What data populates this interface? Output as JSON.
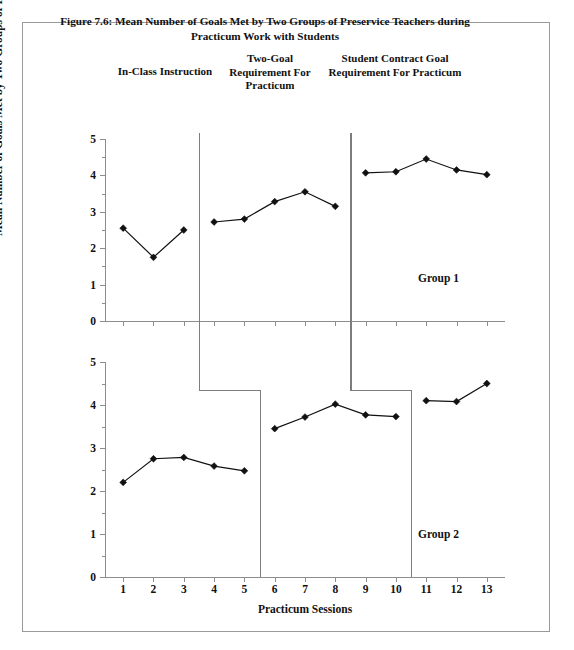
{
  "figure": {
    "title": "Figure 7.6: Mean Number of Goals Met by Two Groups of Preservice Teachers during Practicum Work with Students"
  },
  "phase_labels": [
    "In-Class Instruction",
    "Two-Goal Requirement For Practicum",
    "Student Contract Goal Requirement For Practicum"
  ],
  "group_labels": {
    "upper": "Group 1",
    "lower": "Group 2"
  },
  "axis_titles": {
    "y": "Mean Number of Goals Met by Two Groups of Preservice Teachers",
    "x": "Practicum Sessions"
  },
  "chart_data": [
    {
      "type": "line",
      "title": "Group 1",
      "xlabel": "Practicum Sessions",
      "ylabel": "Mean Number of Goals Met by Two Groups of Preservice Teachers",
      "x": [
        1,
        2,
        3,
        4,
        5,
        6,
        7,
        8,
        9,
        10,
        11,
        12,
        13
      ],
      "xticklabels": [
        "1",
        "2",
        "3",
        "4",
        "5",
        "6",
        "7",
        "8",
        "9",
        "10",
        "11",
        "12",
        "13"
      ],
      "yticklabels": [
        "0",
        "1",
        "2",
        "3",
        "4",
        "5"
      ],
      "ylim": [
        0,
        5
      ],
      "xlim": [
        0.4,
        13.6
      ],
      "grid": false,
      "legend": false,
      "phases": [
        {
          "label": "In-Class Instruction",
          "x": [
            1,
            2,
            3
          ],
          "values": [
            2.55,
            1.75,
            2.5
          ]
        },
        {
          "label": "Two-Goal Requirement For Practicum",
          "x": [
            4,
            5,
            6,
            7,
            8
          ],
          "values": [
            2.72,
            2.8,
            3.28,
            3.55,
            3.15
          ]
        },
        {
          "label": "Student Contract Goal Requirement For Practicum",
          "x": [
            9,
            10,
            11,
            12,
            13
          ],
          "values": [
            4.07,
            4.1,
            4.45,
            4.15,
            4.02
          ]
        }
      ],
      "phase_breaks": [
        3.5,
        8.5
      ]
    },
    {
      "type": "line",
      "title": "Group 2",
      "xlabel": "Practicum Sessions",
      "ylabel": "Mean Number of Goals Met by Two Groups of Preservice Teachers",
      "x": [
        1,
        2,
        3,
        4,
        5,
        6,
        7,
        8,
        9,
        10,
        11,
        12,
        13
      ],
      "xticklabels": [
        "1",
        "2",
        "3",
        "4",
        "5",
        "6",
        "7",
        "8",
        "9",
        "10",
        "11",
        "12",
        "13"
      ],
      "yticklabels": [
        "0",
        "1",
        "2",
        "3",
        "4",
        "5"
      ],
      "ylim": [
        0,
        5
      ],
      "xlim": [
        0.4,
        13.6
      ],
      "grid": false,
      "legend": false,
      "phases": [
        {
          "label": "In-Class Instruction",
          "x": [
            1,
            2,
            3,
            4,
            5
          ],
          "values": [
            2.2,
            2.75,
            2.78,
            2.58,
            2.47
          ]
        },
        {
          "label": "Two-Goal Requirement For Practicum",
          "x": [
            6,
            7,
            8,
            9,
            10
          ],
          "values": [
            3.45,
            3.72,
            4.02,
            3.77,
            3.73
          ]
        },
        {
          "label": "Student Contract Goal Requirement For Practicum",
          "x": [
            11,
            12,
            13
          ],
          "values": [
            4.1,
            4.08,
            4.5
          ]
        }
      ],
      "phase_breaks": [
        5.5,
        10.5
      ]
    }
  ]
}
